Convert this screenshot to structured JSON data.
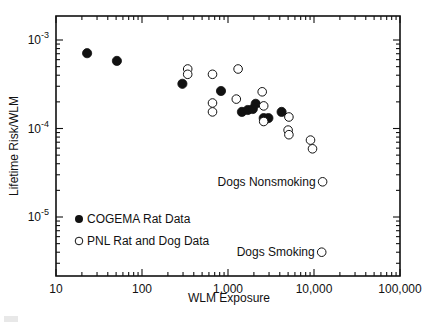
{
  "chart_data": {
    "type": "scatter",
    "title": "",
    "xlabel": "WLM Exposure",
    "ylabel": "Lifetime Risk/WLM",
    "xscale": "log",
    "yscale": "log",
    "xlim": [
      10,
      100000
    ],
    "ylim": [
      2.1e-06,
      0.0019
    ],
    "x_ticks": [
      10,
      100,
      1000,
      10000,
      100000
    ],
    "x_tick_labels": [
      "10",
      "100",
      "1,000",
      "10,000",
      "100,000"
    ],
    "y_ticks": [
      0.001,
      0.0001,
      1e-05
    ],
    "y_tick_labels": [
      {
        "base": "10",
        "exp": "-3"
      },
      {
        "base": "10",
        "exp": "-4"
      },
      {
        "base": "10",
        "exp": "-5"
      }
    ],
    "grid": false,
    "legend_position": "lower-left inside",
    "series": [
      {
        "name": "COGEMA Rat Data",
        "marker": "filled-circle",
        "color": "#111111",
        "points": [
          [
            23,
            0.00071
          ],
          [
            51,
            0.00058
          ],
          [
            295,
            0.00032
          ],
          [
            830,
            0.000265
          ],
          [
            1450,
            0.000154
          ],
          [
            1700,
            0.000162
          ],
          [
            1940,
            0.000166
          ],
          [
            2100,
            0.00019
          ],
          [
            2600,
            0.000131
          ],
          [
            2950,
            0.000131
          ],
          [
            4200,
            0.000154
          ]
        ]
      },
      {
        "name": "PNL Rat and Dog Data",
        "marker": "open-circle",
        "color": "#111111",
        "points": [
          [
            340,
            0.00047
          ],
          [
            340,
            0.00041
          ],
          [
            660,
            0.00041
          ],
          [
            1310,
            0.00047
          ],
          [
            660,
            0.000194
          ],
          [
            660,
            0.000154
          ],
          [
            1250,
            0.000215
          ],
          [
            2500,
            0.00026
          ],
          [
            2600,
            0.00018
          ],
          [
            2600,
            0.00012
          ],
          [
            5100,
            0.000135
          ],
          [
            5000,
            9.6e-05
          ],
          [
            5100,
            8.5e-05
          ],
          [
            9100,
            7.4e-05
          ],
          [
            9600,
            5.9e-05
          ],
          [
            12600,
            2.5e-05
          ],
          [
            12300,
            4e-06
          ]
        ]
      }
    ],
    "annotations": [
      {
        "text": "Dogs Nonsmoking",
        "point": [
          12600,
          2.5e-05
        ],
        "side": "left"
      },
      {
        "text": "Dogs Smoking",
        "point": [
          12300,
          4e-06
        ],
        "side": "left"
      }
    ]
  }
}
